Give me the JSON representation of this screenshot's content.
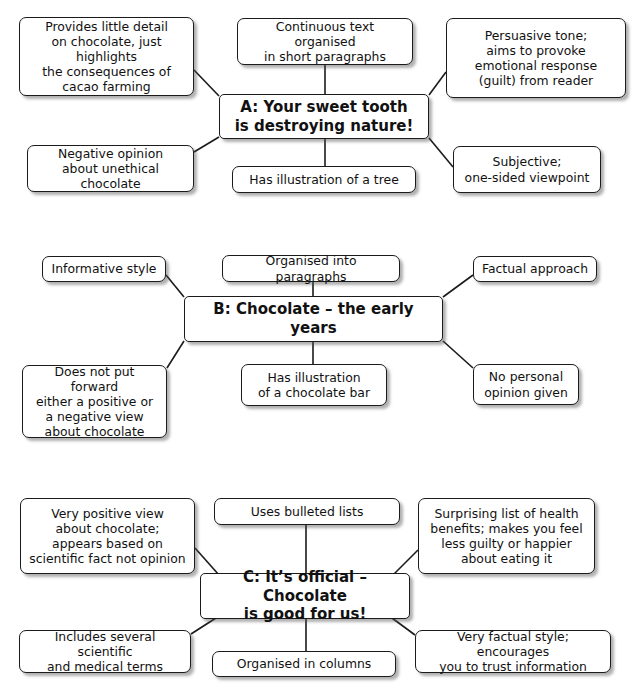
{
  "page": {
    "background_color": "#ffffff",
    "box_fill": "#ffffff",
    "box_border_color": "#1b1b1b",
    "text_color": "#111111",
    "shadow_color": "#787878"
  },
  "diagrams": [
    {
      "id": "A",
      "center": {
        "label": "A: Your sweet tooth\nis destroying nature!",
        "x": 219,
        "y": 94,
        "w": 210,
        "h": 45
      },
      "branches": [
        {
          "name": "provides-little-detail",
          "label": "Provides little detail\non chocolate, just highlights\nthe consequences of\ncacao farming",
          "x": 19,
          "y": 17,
          "w": 175,
          "h": 79
        },
        {
          "name": "continuous-text",
          "label": "Continuous text organised\nin short paragraphs",
          "x": 237,
          "y": 18,
          "w": 176,
          "h": 47
        },
        {
          "name": "persuasive-tone",
          "label": "Persuasive tone;\naims to provoke\nemotional response\n(guilt) from reader",
          "x": 446,
          "y": 18,
          "w": 180,
          "h": 80
        },
        {
          "name": "negative-opinion",
          "label": "Negative opinion\nabout unethical chocolate",
          "x": 27,
          "y": 145,
          "w": 167,
          "h": 47
        },
        {
          "name": "has-illustration-tree",
          "label": "Has illustration of a tree",
          "x": 232,
          "y": 166,
          "w": 184,
          "h": 27
        },
        {
          "name": "subjective-one-sided",
          "label": "Subjective;\none-sided viewpoint",
          "x": 453,
          "y": 146,
          "w": 148,
          "h": 47
        }
      ],
      "connectors": [
        {
          "x1": 194,
          "y1": 70,
          "x2": 219,
          "y2": 96
        },
        {
          "x1": 325,
          "y1": 65,
          "x2": 325,
          "y2": 94
        },
        {
          "x1": 446,
          "y1": 72,
          "x2": 429,
          "y2": 95
        },
        {
          "x1": 194,
          "y1": 152,
          "x2": 219,
          "y2": 137
        },
        {
          "x1": 325,
          "y1": 139,
          "x2": 325,
          "y2": 166
        },
        {
          "x1": 453,
          "y1": 167,
          "x2": 429,
          "y2": 138
        }
      ]
    },
    {
      "id": "B",
      "center": {
        "label": "B: Chocolate – the early years",
        "x": 184,
        "y": 296,
        "w": 259,
        "h": 46
      },
      "branches": [
        {
          "name": "informative-style",
          "label": "Informative style",
          "x": 42,
          "y": 256,
          "w": 124,
          "h": 26
        },
        {
          "name": "organised-into-paragraphs",
          "label": "Organised into paragraphs",
          "x": 222,
          "y": 255,
          "w": 178,
          "h": 27
        },
        {
          "name": "factual-approach",
          "label": "Factual approach",
          "x": 473,
          "y": 256,
          "w": 124,
          "h": 26
        },
        {
          "name": "does-not-put-forward",
          "label": "Does not put forward\neither a positive or\na negative view\nabout chocolate",
          "x": 22,
          "y": 365,
          "w": 145,
          "h": 73
        },
        {
          "name": "has-illustration-chocolate-bar",
          "label": "Has illustration\nof a chocolate bar",
          "x": 241,
          "y": 364,
          "w": 146,
          "h": 42
        },
        {
          "name": "no-personal-opinion",
          "label": "No personal\nopinion given",
          "x": 473,
          "y": 364,
          "w": 106,
          "h": 41
        }
      ],
      "connectors": [
        {
          "x1": 166,
          "y1": 275,
          "x2": 184,
          "y2": 297
        },
        {
          "x1": 313,
          "y1": 282,
          "x2": 313,
          "y2": 296
        },
        {
          "x1": 473,
          "y1": 275,
          "x2": 443,
          "y2": 297
        },
        {
          "x1": 167,
          "y1": 368,
          "x2": 184,
          "y2": 341
        },
        {
          "x1": 313,
          "y1": 342,
          "x2": 313,
          "y2": 364
        },
        {
          "x1": 473,
          "y1": 368,
          "x2": 443,
          "y2": 341
        }
      ]
    },
    {
      "id": "C",
      "center": {
        "label": "C: It’s official – Chocolate\nis good for us!",
        "x": 200,
        "y": 573,
        "w": 210,
        "h": 46
      },
      "branches": [
        {
          "name": "very-positive-view",
          "label": "Very positive view\nabout chocolate;\nappears based on\nscientific fact not opinion",
          "x": 20,
          "y": 498,
          "w": 175,
          "h": 76
        },
        {
          "name": "uses-bulleted-lists",
          "label": "Uses bulleted lists",
          "x": 214,
          "y": 498,
          "w": 186,
          "h": 27
        },
        {
          "name": "surprising-list-health-benefits",
          "label": "Surprising list of health\nbenefits; makes you feel\nless guilty or happier\nabout eating it",
          "x": 418,
          "y": 498,
          "w": 177,
          "h": 76
        },
        {
          "name": "includes-scientific-terms",
          "label": "Includes several scientific\nand medical terms",
          "x": 19,
          "y": 630,
          "w": 172,
          "h": 43
        },
        {
          "name": "organised-in-columns",
          "label": "Organised in columns",
          "x": 212,
          "y": 651,
          "w": 184,
          "h": 26
        },
        {
          "name": "very-factual-style",
          "label": "Very factual style; encourages\nyou to trust information",
          "x": 415,
          "y": 630,
          "w": 196,
          "h": 43
        }
      ],
      "connectors": [
        {
          "x1": 195,
          "y1": 548,
          "x2": 219,
          "y2": 575
        },
        {
          "x1": 306,
          "y1": 525,
          "x2": 306,
          "y2": 573
        },
        {
          "x1": 418,
          "y1": 550,
          "x2": 394,
          "y2": 574
        },
        {
          "x1": 191,
          "y1": 634,
          "x2": 216,
          "y2": 618
        },
        {
          "x1": 306,
          "y1": 619,
          "x2": 306,
          "y2": 651
        },
        {
          "x1": 415,
          "y1": 635,
          "x2": 392,
          "y2": 618
        }
      ]
    }
  ]
}
